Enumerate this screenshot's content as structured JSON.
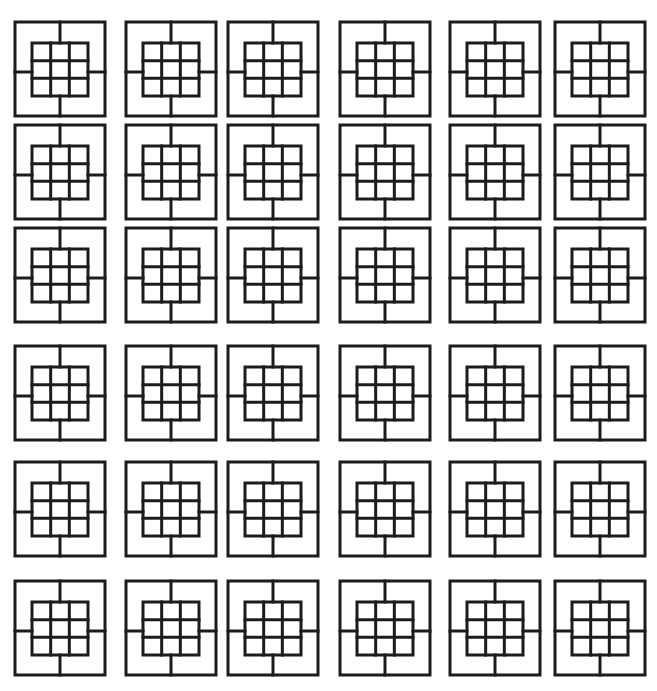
{
  "canvas": {
    "width": 657,
    "height": 691,
    "background": "#ffffff",
    "stroke": "#1c1c1c"
  },
  "tile": {
    "width": 90,
    "height": 94,
    "inner": {
      "x": 17,
      "y": 21,
      "w": 56,
      "h": 53,
      "rows": 3,
      "cols": 3
    },
    "spokes": {
      "top_x": 45,
      "bottom_x": 45,
      "left_y": 50,
      "right_y": 50
    }
  },
  "columns_x": [
    15,
    126,
    228,
    340,
    450,
    555
  ],
  "rows_y": [
    22,
    125,
    228,
    346,
    462,
    581
  ],
  "grid": {
    "rows": 6,
    "cols": 6,
    "count": 36
  }
}
